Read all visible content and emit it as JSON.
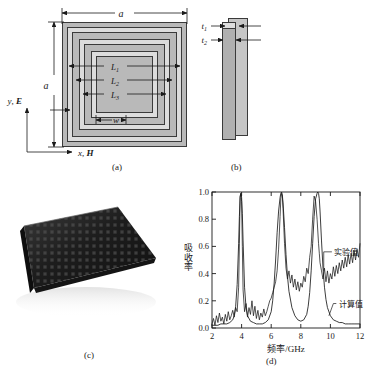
{
  "figure": {
    "caption": ""
  },
  "panel_a": {
    "tag": "(a)",
    "dim_top": "a",
    "dim_left": "a",
    "ring_labels": [
      "L",
      "L",
      "L"
    ],
    "ring_subs": [
      "1",
      "2",
      "3"
    ],
    "width_label": "w",
    "axis_y": "y, E",
    "axis_x": "x, H"
  },
  "panel_b": {
    "tag": "(b)",
    "t1": "t",
    "t1_sub": "1",
    "t2": "t",
    "t2_sub": "2"
  },
  "panel_c": {
    "tag": "(c)",
    "alt": "photograph-of-metamaterial-absorber-sample"
  },
  "panel_d": {
    "tag": "(d)"
  },
  "chart_data": {
    "type": "line",
    "title": "",
    "xlabel": "频率/GHz",
    "ylabel": "吸收率",
    "xlim": [
      2,
      12
    ],
    "ylim": [
      0.0,
      1.0
    ],
    "xticks": [
      2,
      4,
      6,
      8,
      10,
      12
    ],
    "yticks": [
      "0.0",
      "0.2",
      "0.4",
      "0.6",
      "0.8",
      "1.0"
    ],
    "grid": false,
    "legend_position": "inline-annotation",
    "annotations": [
      {
        "text": "实验值",
        "x": 10.3,
        "y": 0.56
      },
      {
        "text": "计算值",
        "x": 10.4,
        "y": 0.18
      }
    ],
    "series": [
      {
        "name": "实验值",
        "style": "noisy",
        "x": [
          2.0,
          2.1,
          2.2,
          2.3,
          2.4,
          2.5,
          2.6,
          2.7,
          2.8,
          2.9,
          3.0,
          3.1,
          3.2,
          3.3,
          3.4,
          3.5,
          3.6,
          3.7,
          3.8,
          3.85,
          3.9,
          3.95,
          4.0,
          4.05,
          4.1,
          4.2,
          4.3,
          4.4,
          4.5,
          4.6,
          4.7,
          4.8,
          4.9,
          5.0,
          5.1,
          5.2,
          5.3,
          5.4,
          5.5,
          5.6,
          5.7,
          5.8,
          5.9,
          6.0,
          6.1,
          6.2,
          6.3,
          6.4,
          6.5,
          6.6,
          6.65,
          6.7,
          6.75,
          6.8,
          6.9,
          7.0,
          7.1,
          7.2,
          7.3,
          7.4,
          7.5,
          7.6,
          7.7,
          7.8,
          7.9,
          8.0,
          8.1,
          8.2,
          8.3,
          8.4,
          8.5,
          8.6,
          8.7,
          8.8,
          8.9,
          9.0,
          9.1,
          9.2,
          9.25,
          9.3,
          9.4,
          9.5,
          9.6,
          9.7,
          9.8,
          9.9,
          10.0,
          10.1,
          10.2,
          10.3,
          10.4,
          10.5,
          10.6,
          10.7,
          10.8,
          10.9,
          11.0,
          11.1,
          11.2,
          11.3,
          11.4,
          11.5,
          11.6,
          11.7,
          11.8,
          11.9,
          12.0
        ],
        "y": [
          0.03,
          0.07,
          0.02,
          0.09,
          0.04,
          0.11,
          0.05,
          0.08,
          0.03,
          0.1,
          0.05,
          0.12,
          0.06,
          0.09,
          0.13,
          0.08,
          0.15,
          0.12,
          0.3,
          0.62,
          0.97,
          0.99,
          0.93,
          0.6,
          0.28,
          0.12,
          0.18,
          0.08,
          0.15,
          0.1,
          0.2,
          0.09,
          0.16,
          0.07,
          0.13,
          0.06,
          0.11,
          0.08,
          0.14,
          0.09,
          0.12,
          0.16,
          0.2,
          0.22,
          0.26,
          0.3,
          0.34,
          0.42,
          0.58,
          0.82,
          0.95,
          0.99,
          0.97,
          0.88,
          0.62,
          0.44,
          0.36,
          0.42,
          0.33,
          0.39,
          0.3,
          0.36,
          0.28,
          0.34,
          0.27,
          0.33,
          0.3,
          0.38,
          0.34,
          0.44,
          0.4,
          0.52,
          0.6,
          0.8,
          0.97,
          0.93,
          0.8,
          0.62,
          0.55,
          0.48,
          0.42,
          0.36,
          0.44,
          0.34,
          0.42,
          0.33,
          0.4,
          0.36,
          0.45,
          0.38,
          0.46,
          0.4,
          0.48,
          0.42,
          0.5,
          0.44,
          0.52,
          0.45,
          0.54,
          0.47,
          0.55,
          0.48,
          0.57,
          0.5,
          0.58,
          0.52,
          0.62
        ]
      },
      {
        "name": "计算值",
        "style": "smooth",
        "x": [
          2.0,
          2.2,
          2.4,
          2.6,
          2.8,
          3.0,
          3.2,
          3.4,
          3.5,
          3.6,
          3.7,
          3.8,
          3.85,
          3.9,
          3.95,
          4.0,
          4.05,
          4.1,
          4.2,
          4.3,
          4.4,
          4.6,
          4.8,
          5.0,
          5.2,
          5.4,
          5.6,
          5.8,
          6.0,
          6.1,
          6.2,
          6.3,
          6.4,
          6.5,
          6.6,
          6.65,
          6.7,
          6.75,
          6.8,
          6.9,
          7.0,
          7.1,
          7.2,
          7.4,
          7.6,
          7.8,
          8.0,
          8.2,
          8.4,
          8.5,
          8.6,
          8.7,
          8.8,
          8.9,
          9.0,
          9.1,
          9.15,
          9.2,
          9.25,
          9.3,
          9.4,
          9.5,
          9.6,
          9.7,
          9.8,
          10.0,
          10.2,
          10.4,
          10.6,
          10.8,
          11.0,
          11.2,
          11.4,
          11.6,
          11.8,
          12.0
        ],
        "y": [
          0.02,
          0.02,
          0.02,
          0.03,
          0.03,
          0.03,
          0.04,
          0.06,
          0.09,
          0.16,
          0.32,
          0.62,
          0.82,
          0.96,
          0.99,
          0.96,
          0.84,
          0.64,
          0.3,
          0.15,
          0.09,
          0.05,
          0.04,
          0.03,
          0.03,
          0.03,
          0.04,
          0.06,
          0.12,
          0.2,
          0.33,
          0.5,
          0.7,
          0.86,
          0.96,
          0.99,
          1.0,
          0.98,
          0.92,
          0.74,
          0.54,
          0.38,
          0.27,
          0.15,
          0.09,
          0.06,
          0.05,
          0.06,
          0.1,
          0.16,
          0.26,
          0.42,
          0.62,
          0.82,
          0.95,
          0.99,
          1.0,
          0.99,
          0.95,
          0.86,
          0.64,
          0.44,
          0.3,
          0.21,
          0.15,
          0.09,
          0.06,
          0.05,
          0.04,
          0.04,
          0.03,
          0.03,
          0.03,
          0.03,
          0.03,
          0.03
        ]
      }
    ]
  }
}
